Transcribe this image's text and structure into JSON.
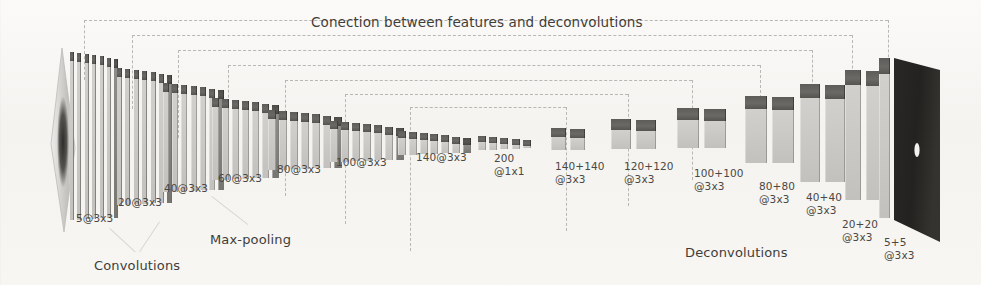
{
  "figure": {
    "title": "Conection between features and deconvolutions",
    "title_x": 311,
    "title_y": 14,
    "background_color": "#f6f5f2",
    "block_top_color": "#5e5c59",
    "block_face_color": "#cdcbc8",
    "pool_block_color": "#85837f",
    "skip_line_color": "#b9b7b3",
    "text_color": "#4a4844"
  },
  "captions": [
    {
      "name": "convolutions",
      "text": "Convolutions",
      "x": 94,
      "y": 258
    },
    {
      "name": "max-pooling",
      "text": "Max-pooling",
      "x": 210,
      "y": 232
    },
    {
      "name": "deconvolutions",
      "text": "Deconvolutions",
      "x": 685,
      "y": 245
    }
  ],
  "input_plane": {
    "name": "input-image-plane",
    "x": 44,
    "y": 48,
    "width": 36,
    "height": 186
  },
  "output_plane": {
    "name": "output-image-plane",
    "x": 890,
    "y": 56,
    "width": 62,
    "height": 192
  },
  "stage_groups": [
    {
      "id": "g1",
      "label": "5@3x3",
      "label_x": 76,
      "label_y": 212,
      "x": 70,
      "top_y": 52,
      "base_y": 220,
      "count": 7,
      "slab_w": 4,
      "gap": 3.4,
      "top_h": 9,
      "thin": true,
      "pool": true
    },
    {
      "id": "g2",
      "label": "20@3x3",
      "label_x": 118,
      "label_y": 196,
      "x": 117,
      "top_y": 68,
      "base_y": 205,
      "count": 7,
      "slab_w": 5,
      "gap": 3.4,
      "top_h": 9,
      "thin": true,
      "pool": true
    },
    {
      "id": "g3",
      "label": "40@3x3",
      "label_x": 164,
      "label_y": 182,
      "x": 163,
      "top_y": 83,
      "base_y": 192,
      "count": 7,
      "slab_w": 6,
      "gap": 3.2,
      "top_h": 9,
      "thin": false,
      "pool": true
    },
    {
      "id": "g4",
      "label": "60@3x3",
      "label_x": 218,
      "label_y": 172,
      "x": 212,
      "top_y": 98,
      "base_y": 180,
      "count": 7,
      "slab_w": 7,
      "gap": 3.0,
      "top_h": 9,
      "thin": false,
      "pool": true
    },
    {
      "id": "g5",
      "label": "80@3x3",
      "label_x": 277,
      "label_y": 163,
      "x": 268,
      "top_y": 110,
      "base_y": 170,
      "count": 7,
      "slab_w": 8,
      "gap": 3.0,
      "top_h": 9,
      "thin": false,
      "pool": true
    },
    {
      "id": "g6",
      "label": "100@3x3",
      "label_x": 336,
      "label_y": 156,
      "x": 330,
      "top_y": 121,
      "base_y": 162,
      "count": 7,
      "slab_w": 8,
      "gap": 3.0,
      "top_h": 8,
      "thin": false,
      "pool": true
    },
    {
      "id": "g7",
      "label": "140@3x3",
      "label_x": 416,
      "label_y": 151,
      "x": 398,
      "top_y": 131,
      "base_y": 155,
      "count": 7,
      "slab_w": 8,
      "gap": 2.8,
      "top_h": 7,
      "thin": false,
      "pool": true
    },
    {
      "id": "g8",
      "label": "200\n@1x1",
      "label_x": 494,
      "label_y": 152,
      "x": 478,
      "top_y": 136,
      "base_y": 150,
      "count": 5,
      "slab_w": 8,
      "gap": 3.2,
      "top_h": 6,
      "thin": false,
      "pool": false
    },
    {
      "id": "g9",
      "label": "140+140\n@3x3",
      "label_x": 555,
      "label_y": 160,
      "x": 551,
      "top_y": 128,
      "base_y": 150,
      "count": 2,
      "slab_w": 15,
      "gap": 4.0,
      "top_h": 9,
      "thin": false,
      "pool": false
    },
    {
      "id": "g10",
      "label": "120+120\n@3x3",
      "label_x": 624,
      "label_y": 160,
      "x": 611,
      "top_y": 119,
      "base_y": 149,
      "count": 2,
      "slab_w": 20,
      "gap": 4.5,
      "top_h": 11,
      "thin": false,
      "pool": false
    },
    {
      "id": "g11",
      "label": "100+100\n@3x3",
      "label_x": 694,
      "label_y": 167,
      "x": 677,
      "top_y": 108,
      "base_y": 148,
      "count": 2,
      "slab_w": 22,
      "gap": 5.0,
      "top_h": 12,
      "thin": false,
      "pool": false
    },
    {
      "id": "g12",
      "label": "80+80\n@3x3",
      "label_x": 759,
      "label_y": 180,
      "x": 745,
      "top_y": 96,
      "base_y": 163,
      "count": 2,
      "slab_w": 22,
      "gap": 5.0,
      "top_h": 13,
      "thin": false,
      "pool": false
    },
    {
      "id": "g13",
      "label": "40+40\n@3x3",
      "label_x": 806,
      "label_y": 191,
      "x": 800,
      "top_y": 84,
      "base_y": 182,
      "count": 2,
      "slab_w": 20,
      "gap": 5.0,
      "top_h": 14,
      "thin": false,
      "pool": false
    },
    {
      "id": "g14",
      "label": "20+20\n@3x3",
      "label_x": 842,
      "label_y": 218,
      "x": 845,
      "top_y": 70,
      "base_y": 200,
      "count": 2,
      "slab_w": 16,
      "gap": 5.0,
      "top_h": 15,
      "thin": false,
      "pool": false
    },
    {
      "id": "g15",
      "label": "5+5\n@3x3",
      "label_x": 884,
      "label_y": 236,
      "x": 879,
      "top_y": 58,
      "base_y": 218,
      "count": 1,
      "slab_w": 11,
      "gap": 4.0,
      "top_h": 16,
      "thin": false,
      "pool": false
    }
  ],
  "skip_connections": [
    {
      "name": "skip-1",
      "from_x": 84,
      "to_x": 888,
      "y": 20
    },
    {
      "name": "skip-2",
      "from_x": 132,
      "to_x": 852,
      "y": 35
    },
    {
      "name": "skip-3",
      "from_x": 178,
      "to_x": 812,
      "y": 50
    },
    {
      "name": "skip-4",
      "from_x": 228,
      "to_x": 760,
      "y": 65
    },
    {
      "name": "skip-5",
      "from_x": 285,
      "to_x": 692,
      "y": 80
    },
    {
      "name": "skip-6",
      "from_x": 345,
      "to_x": 628,
      "y": 94
    },
    {
      "name": "skip-7",
      "from_x": 410,
      "to_x": 566,
      "y": 107
    }
  ],
  "leader_lines": [
    {
      "name": "leader-conv-left",
      "x1": 110,
      "y1": 228,
      "x2": 136,
      "y2": 252
    },
    {
      "name": "leader-conv-right",
      "x1": 160,
      "y1": 222,
      "x2": 140,
      "y2": 252
    },
    {
      "name": "leader-pool",
      "x1": 212,
      "y1": 196,
      "x2": 248,
      "y2": 224
    }
  ]
}
